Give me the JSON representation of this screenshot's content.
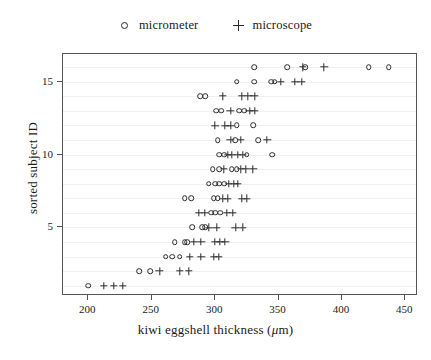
{
  "chart_data": {
    "type": "scatter",
    "title": "",
    "xlabel": "kiwi eggshell thickness (μm)",
    "ylabel": "sorted subject ID",
    "xlim": [
      180,
      460
    ],
    "ylim": [
      0.3,
      16.9
    ],
    "xticks": [
      200,
      250,
      300,
      350,
      400,
      450
    ],
    "xticklabels": [
      "200",
      "250",
      "300",
      "350",
      "400",
      "450"
    ],
    "yticks": [
      5,
      10,
      15
    ],
    "yticklabels": [
      "5",
      "10",
      "15"
    ],
    "grid": "horizontal-minor",
    "legend_position": "top-center",
    "series": [
      {
        "name": "micrometer",
        "marker": "circle",
        "color": "#2b2b2b",
        "points": [
          [
            200,
            1
          ],
          [
            240,
            2
          ],
          [
            249,
            2
          ],
          [
            261,
            3
          ],
          [
            266,
            3
          ],
          [
            272,
            3
          ],
          [
            268,
            4
          ],
          [
            276,
            4
          ],
          [
            278,
            4
          ],
          [
            282,
            5
          ],
          [
            290,
            5
          ],
          [
            292,
            5
          ],
          [
            297,
            6
          ],
          [
            300,
            6
          ],
          [
            304,
            6
          ],
          [
            276,
            7
          ],
          [
            281,
            7
          ],
          [
            299,
            7
          ],
          [
            302,
            7
          ],
          [
            295,
            8
          ],
          [
            300,
            8
          ],
          [
            303,
            8
          ],
          [
            307,
            8
          ],
          [
            298,
            9
          ],
          [
            303,
            9
          ],
          [
            313,
            9
          ],
          [
            317,
            9
          ],
          [
            303,
            10
          ],
          [
            307,
            10
          ],
          [
            325,
            10
          ],
          [
            345,
            10
          ],
          [
            302,
            11
          ],
          [
            316,
            11
          ],
          [
            334,
            11
          ],
          [
            317,
            12
          ],
          [
            330,
            12
          ],
          [
            301,
            13
          ],
          [
            305,
            13
          ],
          [
            319,
            13
          ],
          [
            323,
            13
          ],
          [
            288,
            14
          ],
          [
            292,
            14
          ],
          [
            317,
            15
          ],
          [
            331,
            15
          ],
          [
            344,
            15
          ],
          [
            347,
            15
          ],
          [
            331,
            16
          ],
          [
            357,
            16
          ],
          [
            371,
            16
          ],
          [
            421,
            16
          ],
          [
            437,
            16
          ]
        ]
      },
      {
        "name": "microscope",
        "marker": "plus",
        "color": "#2b2b2b",
        "points": [
          [
            212,
            1
          ],
          [
            220,
            1
          ],
          [
            227,
            1
          ],
          [
            256,
            2
          ],
          [
            272,
            2
          ],
          [
            279,
            2
          ],
          [
            280,
            3
          ],
          [
            289,
            3
          ],
          [
            299,
            3
          ],
          [
            303,
            3
          ],
          [
            283,
            4
          ],
          [
            289,
            4
          ],
          [
            300,
            4
          ],
          [
            304,
            4
          ],
          [
            308,
            4
          ],
          [
            295,
            5
          ],
          [
            301,
            5
          ],
          [
            316,
            5
          ],
          [
            322,
            5
          ],
          [
            287,
            6
          ],
          [
            292,
            6
          ],
          [
            309,
            6
          ],
          [
            314,
            6
          ],
          [
            306,
            7
          ],
          [
            310,
            7
          ],
          [
            321,
            7
          ],
          [
            325,
            7
          ],
          [
            311,
            8
          ],
          [
            315,
            8
          ],
          [
            318,
            8
          ],
          [
            307,
            9
          ],
          [
            320,
            9
          ],
          [
            324,
            9
          ],
          [
            330,
            9
          ],
          [
            310,
            10
          ],
          [
            313,
            10
          ],
          [
            318,
            10
          ],
          [
            322,
            10
          ],
          [
            312,
            11
          ],
          [
            320,
            11
          ],
          [
            341,
            11
          ],
          [
            300,
            12
          ],
          [
            308,
            12
          ],
          [
            312,
            12
          ],
          [
            312,
            13
          ],
          [
            327,
            13
          ],
          [
            331,
            13
          ],
          [
            306,
            14
          ],
          [
            321,
            14
          ],
          [
            326,
            14
          ],
          [
            331,
            14
          ],
          [
            352,
            15
          ],
          [
            363,
            15
          ],
          [
            368,
            15
          ],
          [
            369,
            16
          ],
          [
            386,
            16
          ]
        ]
      }
    ]
  },
  "legend": {
    "entries": [
      {
        "label": "micrometer",
        "marker": "circle"
      },
      {
        "label": "microscope",
        "marker": "plus"
      }
    ]
  }
}
